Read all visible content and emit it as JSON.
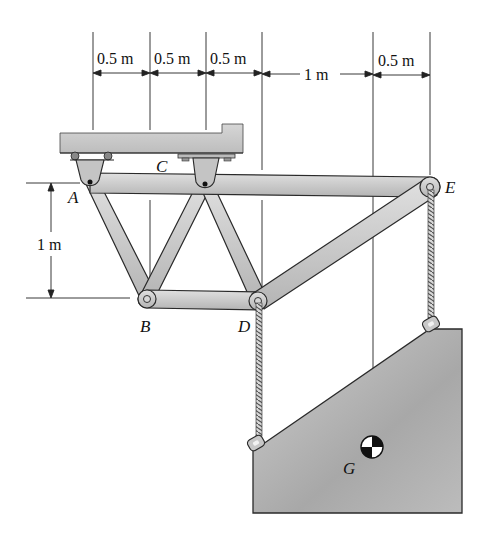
{
  "figure": {
    "type": "truss-statics-problem",
    "dimensions": {
      "top": [
        "0.5 m",
        "0.5 m",
        "0.5 m",
        "1 m",
        "0.5 m"
      ],
      "vertical": "1 m"
    },
    "points": {
      "A": "A",
      "B": "B",
      "C": "C",
      "D": "D",
      "E": "E",
      "G": "G"
    },
    "colors": {
      "member_fill": "#c9c9c9",
      "member_stroke": "#2a2a2a",
      "support_fill": "#c4c4c4",
      "block_fill": "#b3b3b3",
      "line": "#222222",
      "background": "#ffffff"
    }
  }
}
